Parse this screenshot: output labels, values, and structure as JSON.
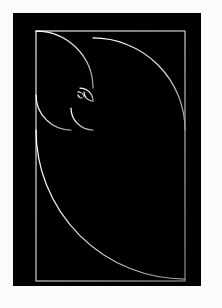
{
  "artwork": {
    "title": "Fibonacci Golden Spiral",
    "subject": "golden-ratio-rectangle-subdivision",
    "canvas": {
      "width": 222,
      "height": 308
    },
    "colors": {
      "matte": "#fbfbfb",
      "background": "#000000",
      "line": "#d8d8d8",
      "line_bright": "#ffffff"
    },
    "matte": {
      "left": 13,
      "top": 13,
      "right": 21,
      "bottom": 22
    },
    "plate": {
      "x": 13,
      "y": 13,
      "width": 188,
      "height": 273
    },
    "golden_rectangle": {
      "x": 36,
      "y": 31,
      "width": 149,
      "height": 250,
      "ratio": "1.618"
    },
    "stroke_width": 1.1,
    "squares": [
      {
        "name": "square-1-largest",
        "order": 1,
        "x": 36,
        "y": 130,
        "size": 151,
        "arc_from": "bottom-left",
        "arc_to": "top-right"
      },
      {
        "name": "square-2",
        "order": 2,
        "x": 93,
        "y": 31,
        "size": 92,
        "arc_from": "top-left",
        "arc_to": "bottom-right"
      },
      {
        "name": "square-3",
        "order": 3,
        "x": 36,
        "y": 31,
        "size": 57,
        "arc_from": "bottom-left",
        "arc_to": "top-right"
      },
      {
        "name": "square-4",
        "order": 4,
        "x": 36,
        "y": 88,
        "size": 35,
        "arc_from": "top-left",
        "arc_to": "bottom-right"
      },
      {
        "name": "square-5",
        "order": 5,
        "x": 71,
        "y": 108,
        "size": 22,
        "arc_from": "bottom-right",
        "arc_to": "top-left"
      },
      {
        "name": "square-6",
        "order": 6,
        "x": 71,
        "y": 88,
        "size": 13,
        "arc_from": "top-right",
        "arc_to": "bottom-left"
      },
      {
        "name": "square-7",
        "order": 7,
        "x": 84,
        "y": 88,
        "size": 9,
        "arc_from": "top-left",
        "arc_to": "bottom-right"
      },
      {
        "name": "square-8",
        "order": 8,
        "x": 84,
        "y": 97,
        "size": 6,
        "arc_from": "bottom-left",
        "arc_to": "top-right"
      },
      {
        "name": "square-9",
        "order": 9,
        "x": 78,
        "y": 97,
        "size": 4,
        "arc_from": "bottom-right",
        "arc_to": "top-left"
      },
      {
        "name": "square-10-smallest",
        "order": 10,
        "x": 78,
        "y": 93,
        "size": 2,
        "arc_from": "top-right",
        "arc_to": "bottom-left"
      }
    ],
    "spiral_path": "M 36 281 A 151 151 0 0 1 187 130 A 92 92 0 0 1 95 38 A 57 57 0 0 1 38 95 A 35 35 0 0 1 73 130 A 22 22 0 0 1 95 108 A 13 13 0 0 1 82 95 A 9 9 0 0 1 91 86 A 6 6 0 0 1 97 92",
    "divider_lines": [
      {
        "name": "divider-h-main",
        "x1": 36,
        "y1": 130,
        "x2": 185,
        "y2": 130
      },
      {
        "name": "divider-v-upper",
        "x1": 93,
        "y1": 31,
        "x2": 93,
        "y2": 130
      },
      {
        "name": "divider-h-upper-left",
        "x1": 36,
        "y1": 88,
        "x2": 93,
        "y2": 88
      },
      {
        "name": "divider-v-mid",
        "x1": 71,
        "y1": 88,
        "x2": 71,
        "y2": 130
      },
      {
        "name": "divider-h-mid",
        "x1": 71,
        "y1": 108,
        "x2": 93,
        "y2": 108
      },
      {
        "name": "divider-h-small",
        "x1": 71,
        "y1": 97,
        "x2": 93,
        "y2": 97
      },
      {
        "name": "divider-v-small",
        "x1": 84,
        "y1": 88,
        "x2": 84,
        "y2": 97
      },
      {
        "name": "divider-v-tiny",
        "x1": 78,
        "y1": 93,
        "x2": 78,
        "y2": 101
      },
      {
        "name": "divider-h-tiny",
        "x1": 78,
        "y1": 93,
        "x2": 90,
        "y2": 93
      }
    ]
  }
}
